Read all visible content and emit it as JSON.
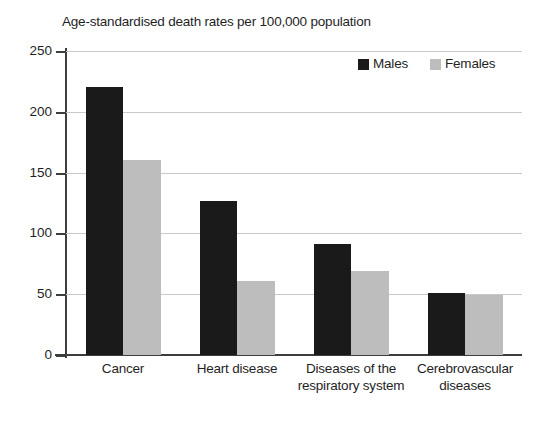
{
  "chart_data": {
    "type": "bar",
    "title": "Age-standardised death rates per 100,000 population",
    "xlabel": "",
    "ylabel": "",
    "ylim": [
      0,
      250
    ],
    "yticks": [
      0,
      50,
      100,
      150,
      200,
      250
    ],
    "ytick_labels": [
      "0",
      "50",
      "100",
      "150",
      "200",
      "250"
    ],
    "grid": true,
    "legend_position": "top-right",
    "categories": [
      "Cancer",
      "Heart disease",
      "Diseases of the respiratory system",
      "Cerebrovascular diseases"
    ],
    "series": [
      {
        "name": "Males",
        "color": "#1a1a1a",
        "values": [
          220,
          127,
          91,
          51
        ]
      },
      {
        "name": "Females",
        "color": "#bdbdbd",
        "values": [
          160,
          61,
          69,
          49
        ]
      }
    ]
  }
}
